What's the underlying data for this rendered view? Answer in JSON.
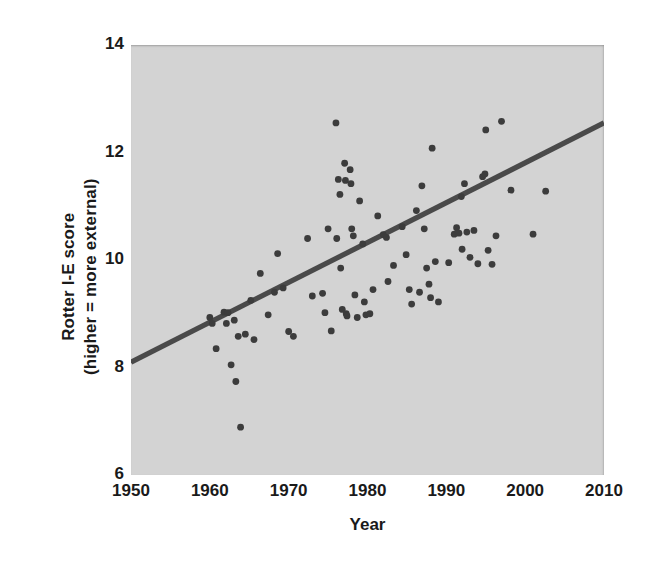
{
  "chart_data": {
    "type": "scatter",
    "title": "",
    "xlabel": "Year",
    "ylabel": "Rotter I-E score (higher = more external)",
    "ylabel_lines": [
      "Rotter I-E score",
      "(higher = more external)"
    ],
    "xlim": [
      1950,
      2010
    ],
    "ylim": [
      6,
      14
    ],
    "xticks": [
      1950,
      1960,
      1970,
      1980,
      1990,
      2000,
      2010
    ],
    "yticks": [
      6,
      8,
      10,
      12,
      14
    ],
    "grid": false,
    "legend": null,
    "panel_background": "#d3d3d3",
    "point_color": "#3c3c3c",
    "trend_color": "#4a4a4a",
    "trend_line": {
      "label": "linear regression",
      "x": [
        1950,
        2010
      ],
      "y": [
        8.1,
        12.55
      ]
    },
    "points": [
      {
        "x": 1960.0,
        "y": 8.93
      },
      {
        "x": 1960.3,
        "y": 8.82
      },
      {
        "x": 1960.8,
        "y": 8.35
      },
      {
        "x": 1961.8,
        "y": 9.03
      },
      {
        "x": 1962.1,
        "y": 8.82
      },
      {
        "x": 1962.3,
        "y": 9.02
      },
      {
        "x": 1962.7,
        "y": 8.05
      },
      {
        "x": 1963.1,
        "y": 8.88
      },
      {
        "x": 1963.3,
        "y": 7.74
      },
      {
        "x": 1963.6,
        "y": 8.58
      },
      {
        "x": 1963.9,
        "y": 6.89
      },
      {
        "x": 1964.5,
        "y": 8.62
      },
      {
        "x": 1965.2,
        "y": 9.25
      },
      {
        "x": 1965.6,
        "y": 8.52
      },
      {
        "x": 1966.4,
        "y": 9.75
      },
      {
        "x": 1967.4,
        "y": 8.98
      },
      {
        "x": 1968.2,
        "y": 9.4
      },
      {
        "x": 1968.6,
        "y": 10.12
      },
      {
        "x": 1969.3,
        "y": 9.48
      },
      {
        "x": 1970.0,
        "y": 8.67
      },
      {
        "x": 1970.6,
        "y": 8.58
      },
      {
        "x": 1972.4,
        "y": 10.4
      },
      {
        "x": 1973.0,
        "y": 9.33
      },
      {
        "x": 1974.3,
        "y": 9.38
      },
      {
        "x": 1974.6,
        "y": 9.02
      },
      {
        "x": 1975.0,
        "y": 10.58
      },
      {
        "x": 1975.4,
        "y": 8.68
      },
      {
        "x": 1976.0,
        "y": 12.55
      },
      {
        "x": 1976.1,
        "y": 10.4
      },
      {
        "x": 1976.3,
        "y": 11.5
      },
      {
        "x": 1976.5,
        "y": 11.22
      },
      {
        "x": 1976.6,
        "y": 9.85
      },
      {
        "x": 1976.8,
        "y": 9.08
      },
      {
        "x": 1977.1,
        "y": 11.8
      },
      {
        "x": 1977.2,
        "y": 11.48
      },
      {
        "x": 1977.3,
        "y": 9.0
      },
      {
        "x": 1977.4,
        "y": 8.96
      },
      {
        "x": 1977.8,
        "y": 11.68
      },
      {
        "x": 1977.9,
        "y": 11.42
      },
      {
        "x": 1978.0,
        "y": 10.58
      },
      {
        "x": 1978.2,
        "y": 10.45
      },
      {
        "x": 1978.4,
        "y": 9.35
      },
      {
        "x": 1978.7,
        "y": 8.93
      },
      {
        "x": 1979.0,
        "y": 11.1
      },
      {
        "x": 1979.4,
        "y": 10.3
      },
      {
        "x": 1979.6,
        "y": 9.22
      },
      {
        "x": 1979.8,
        "y": 8.98
      },
      {
        "x": 1980.3,
        "y": 9.0
      },
      {
        "x": 1980.7,
        "y": 9.45
      },
      {
        "x": 1981.3,
        "y": 10.82
      },
      {
        "x": 1982.0,
        "y": 10.47
      },
      {
        "x": 1982.4,
        "y": 10.42
      },
      {
        "x": 1982.6,
        "y": 9.6
      },
      {
        "x": 1983.3,
        "y": 9.9
      },
      {
        "x": 1984.4,
        "y": 10.62
      },
      {
        "x": 1984.9,
        "y": 10.1
      },
      {
        "x": 1985.3,
        "y": 9.45
      },
      {
        "x": 1985.6,
        "y": 9.18
      },
      {
        "x": 1986.2,
        "y": 10.92
      },
      {
        "x": 1986.6,
        "y": 9.4
      },
      {
        "x": 1986.9,
        "y": 11.38
      },
      {
        "x": 1987.2,
        "y": 10.58
      },
      {
        "x": 1987.5,
        "y": 9.85
      },
      {
        "x": 1987.8,
        "y": 9.55
      },
      {
        "x": 1988.0,
        "y": 9.3
      },
      {
        "x": 1988.2,
        "y": 12.08
      },
      {
        "x": 1988.6,
        "y": 9.97
      },
      {
        "x": 1989.0,
        "y": 9.22
      },
      {
        "x": 1990.3,
        "y": 9.95
      },
      {
        "x": 1991.0,
        "y": 10.48
      },
      {
        "x": 1991.3,
        "y": 10.6
      },
      {
        "x": 1991.6,
        "y": 10.5
      },
      {
        "x": 1991.9,
        "y": 11.18
      },
      {
        "x": 1992.0,
        "y": 10.2
      },
      {
        "x": 1992.3,
        "y": 11.42
      },
      {
        "x": 1992.6,
        "y": 10.52
      },
      {
        "x": 1993.0,
        "y": 10.05
      },
      {
        "x": 1993.5,
        "y": 10.55
      },
      {
        "x": 1994.0,
        "y": 9.93
      },
      {
        "x": 1994.6,
        "y": 11.55
      },
      {
        "x": 1994.9,
        "y": 11.6
      },
      {
        "x": 1995.0,
        "y": 12.42
      },
      {
        "x": 1995.3,
        "y": 10.18
      },
      {
        "x": 1995.8,
        "y": 9.92
      },
      {
        "x": 1996.3,
        "y": 10.45
      },
      {
        "x": 1997.0,
        "y": 12.58
      },
      {
        "x": 1998.2,
        "y": 11.3
      },
      {
        "x": 2001.0,
        "y": 10.48
      },
      {
        "x": 2002.6,
        "y": 11.28
      }
    ]
  }
}
